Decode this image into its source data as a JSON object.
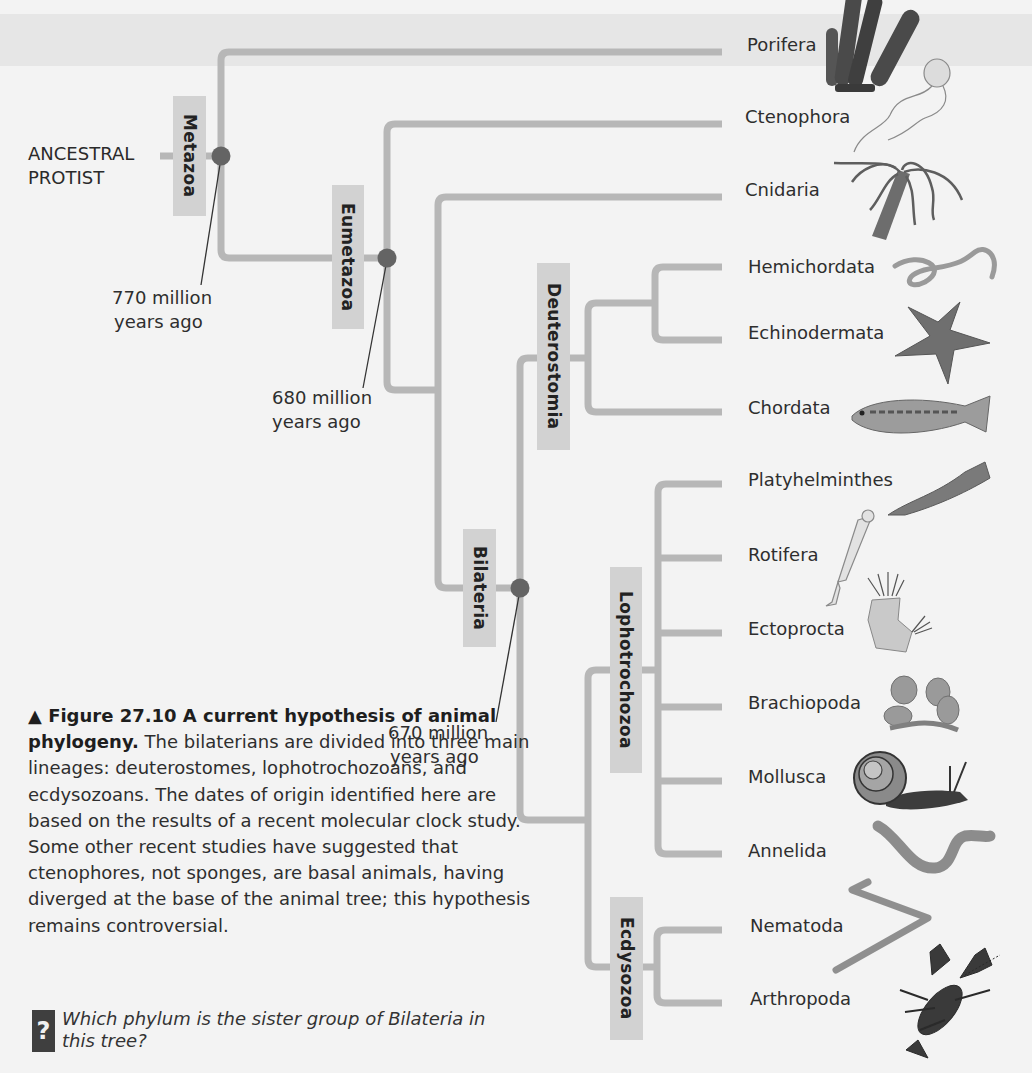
{
  "figure": {
    "root_label": [
      "ANCESTRAL",
      "PROTIST"
    ],
    "branch_color": "#b7b7b7",
    "node_color": "#646464",
    "clade_box_color": "#d2d2d2",
    "clades": [
      {
        "name": "Metazoa"
      },
      {
        "name": "Eumetazoa"
      },
      {
        "name": "Bilateria"
      },
      {
        "name": "Deuterostomia"
      },
      {
        "name": "Lophotrochozoa"
      },
      {
        "name": "Ecdysozoa"
      }
    ],
    "dates": [
      {
        "line1": "770 million",
        "line2": "years ago",
        "clade": "Metazoa"
      },
      {
        "line1": "680 million",
        "line2": "years ago",
        "clade": "Eumetazoa"
      },
      {
        "line1": "670 million",
        "line2": "years ago",
        "clade": "Bilateria"
      }
    ],
    "phyla": [
      {
        "name": "Porifera",
        "icon": "sponge-icon"
      },
      {
        "name": "Ctenophora",
        "icon": "comb-jelly-icon"
      },
      {
        "name": "Cnidaria",
        "icon": "hydra-icon"
      },
      {
        "name": "Hemichordata",
        "icon": "acorn-worm-icon"
      },
      {
        "name": "Echinodermata",
        "icon": "sea-star-icon"
      },
      {
        "name": "Chordata",
        "icon": "fish-icon"
      },
      {
        "name": "Platyhelminthes",
        "icon": "flatworm-icon"
      },
      {
        "name": "Rotifera",
        "icon": "rotifer-icon"
      },
      {
        "name": "Ectoprocta",
        "icon": "bryozoan-icon"
      },
      {
        "name": "Brachiopoda",
        "icon": "brachiopod-icon"
      },
      {
        "name": "Mollusca",
        "icon": "snail-icon"
      },
      {
        "name": "Annelida",
        "icon": "earthworm-icon"
      },
      {
        "name": "Nematoda",
        "icon": "roundworm-icon"
      },
      {
        "name": "Arthropoda",
        "icon": "crayfish-icon"
      }
    ]
  },
  "caption": {
    "marker": "▲",
    "title": "Figure 27.10  A current hypothesis of animal phylogeny.",
    "body": " The bilaterians are divided into three main lineages: deuterostomes, lophotrochozoans, and ecdysozoans. The dates of origin identified here are based on the results of a recent molecular clock study. Some other recent studies have suggested that ctenophores, not sponges, are basal animals, having diverged at the base of the animal tree; this hypothesis remains controversial."
  },
  "question": {
    "icon": "?",
    "text": "Which phylum is the sister group of Bilateria in this tree?"
  }
}
